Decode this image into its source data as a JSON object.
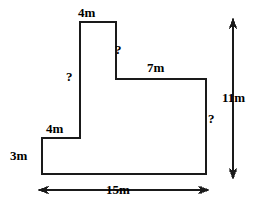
{
  "figure": {
    "units": "m",
    "stroke_color": "#1a1a1a",
    "background_color": "#ffffff",
    "text_color": "#000000",
    "labels": {
      "top_4m": "4m",
      "left_unknown": "?",
      "notch_unknown": "?",
      "seven_m": "7m",
      "step_4m": "4m",
      "three_m": "3m",
      "right_unknown": "?",
      "overall_height_11m": "11m",
      "overall_width_15m": "15m"
    },
    "shape": {
      "type": "polygon",
      "description": "L-shaped / stepped polygon outline",
      "vertices": [
        {
          "name": "notch-top-left",
          "x": 80,
          "y": 22
        },
        {
          "name": "notch-top-right",
          "x": 116,
          "y": 22
        },
        {
          "name": "notch-bottom-right",
          "x": 116,
          "y": 79
        },
        {
          "name": "upper-right",
          "x": 206,
          "y": 79
        },
        {
          "name": "bottom-right",
          "x": 206,
          "y": 174
        },
        {
          "name": "bottom-left",
          "x": 42,
          "y": 174
        },
        {
          "name": "step-left-top",
          "x": 42,
          "y": 138
        },
        {
          "name": "step-right-top",
          "x": 80,
          "y": 138
        }
      ],
      "edges": [
        {
          "name": "top-edge",
          "label": "4m",
          "orientation": "horizontal"
        },
        {
          "name": "notch-right-edge",
          "label": "?",
          "orientation": "vertical"
        },
        {
          "name": "upper-horizontal",
          "label": "7m",
          "orientation": "horizontal"
        },
        {
          "name": "far-right-edge",
          "label": "?",
          "orientation": "vertical"
        },
        {
          "name": "bottom-edge",
          "label": "15m",
          "orientation": "horizontal"
        },
        {
          "name": "left-edge",
          "label": "3m",
          "orientation": "vertical"
        },
        {
          "name": "step-horizontal",
          "label": "4m",
          "orientation": "horizontal"
        },
        {
          "name": "notch-left-edge",
          "label": "?",
          "orientation": "vertical"
        }
      ]
    },
    "dimension_lines": [
      {
        "name": "height-dimension",
        "label": "11m",
        "orientation": "vertical",
        "x": 233,
        "y_start": 20,
        "y_end": 177,
        "arrowheads": "both"
      },
      {
        "name": "width-dimension",
        "label": "15m",
        "orientation": "horizontal",
        "y": 190,
        "x_start": 40,
        "x_end": 207,
        "arrowheads": "both"
      }
    ]
  }
}
